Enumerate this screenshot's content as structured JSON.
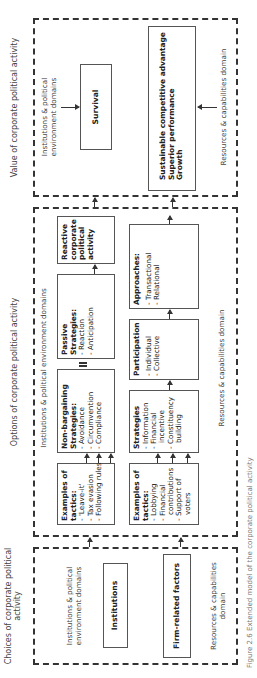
{
  "headings": {
    "choices": "Choices of corporate political activity",
    "options": "Options of corporate political activity",
    "value": "Value of corporate political activity"
  },
  "choices_panel": {
    "domain_institutions": "Institutions & political environment domains",
    "domain_resources": "Resources & capabilities domain",
    "institutions_box": "Institutions",
    "firm_box": "Firm-related factors"
  },
  "options_panel": {
    "domain_institutions": "Institutions & political environment domains",
    "domain_resources": "Resources & capabilities domain",
    "tactics_top": {
      "title": "Examples of tactics:",
      "items": [
        "- 'Leave-it'",
        "- Tax evasion",
        "- Following rules"
      ]
    },
    "nonbargaining": {
      "title": "Non-bargaining Strategies:",
      "items": [
        "- Avoidance",
        "- Circumvention",
        "- Compliance"
      ]
    },
    "passive": {
      "title": "Passive Strategies:",
      "items": [
        "- Reaction",
        "- Anticipation"
      ]
    },
    "reactive": "Reactive corporate political activity",
    "tactics_bottom": {
      "title": "Examples of tactics:",
      "items": [
        "- Lobbying",
        "- Financial",
        "contributions",
        "- Support of",
        "voters"
      ]
    },
    "strategies": {
      "title": "Strategies",
      "items": [
        "- Information",
        "- Financial",
        "incentive",
        "- Constituency",
        "building"
      ]
    },
    "participation": {
      "title": "Participation",
      "items": [
        "- Individual",
        "- Collective"
      ]
    },
    "approaches": {
      "title": "Approaches:",
      "items": [
        "- Transactional",
        "- Relational"
      ]
    },
    "proactive": "Proactive corporate political activity"
  },
  "value_panel": {
    "domain_institutions": "Institutions & political environment domains",
    "domain_resources": "Resources & capabilities domain",
    "survival_box": "Survival",
    "outcomes_box": [
      "Sustainable competitive advantage",
      "Superior performance",
      "Growth"
    ]
  },
  "caption": "Figure 2.6  Extended model of the corporate political activity"
}
